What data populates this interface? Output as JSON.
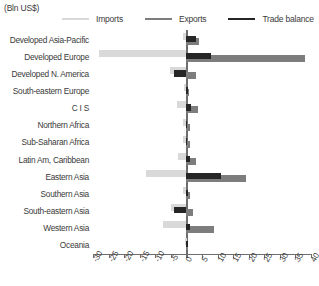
{
  "chart_data": {
    "type": "bar",
    "orientation": "horizontal",
    "title": "",
    "unit_label": "(Bln US$)",
    "xlabel": "",
    "ylabel": "",
    "xlim": [
      -30,
      40
    ],
    "xticks": [
      -30,
      -25,
      -20,
      -15,
      -10,
      -5,
      0,
      5,
      10,
      15,
      20,
      25,
      30,
      35,
      40
    ],
    "xtick_labels": [
      "-30",
      "-25",
      "-20",
      "-15",
      "-10",
      "-5",
      "0",
      "5",
      "10",
      "15",
      "20",
      "25",
      "30",
      "35",
      "40"
    ],
    "grid": false,
    "legend_position": "top",
    "categories": [
      "Developed Asia-Pacific",
      "Developed Europe",
      "Developed N. America",
      "South-eastern Europe",
      "C I S",
      "Northern Africa",
      "Sub-Saharan Africa",
      "Latin Am, Caribbean",
      "Eastern Asia",
      "Southern Asia",
      "South-eastern Asia",
      "Western Asia",
      "Oceania"
    ],
    "series": [
      {
        "name": "Imports",
        "color": "#d9d9d9",
        "values": [
          -1.0,
          -28.0,
          -5.2,
          -0.8,
          -3.0,
          -1.0,
          -1.2,
          -2.8,
          -13.0,
          -1.0,
          -5.0,
          -7.5,
          -0.3
        ]
      },
      {
        "name": "Exports",
        "color": "#7d7d7d",
        "values": [
          4.0,
          38.0,
          3.0,
          0.8,
          3.8,
          1.0,
          1.3,
          3.2,
          19.0,
          1.2,
          2.0,
          9.0,
          0.4
        ]
      },
      {
        "name": "Trade balance",
        "color": "#262626",
        "values": [
          3.0,
          8.0,
          -4.0,
          0.2,
          1.5,
          -0.2,
          -0.2,
          1.0,
          11.0,
          0.5,
          -4.0,
          1.0,
          0.1
        ]
      }
    ]
  },
  "legend": {
    "items": [
      {
        "label": "Imports",
        "color": "#d9d9d9"
      },
      {
        "label": "Exports",
        "color": "#7d7d7d"
      },
      {
        "label": "Trade balance",
        "color": "#262626"
      }
    ]
  }
}
